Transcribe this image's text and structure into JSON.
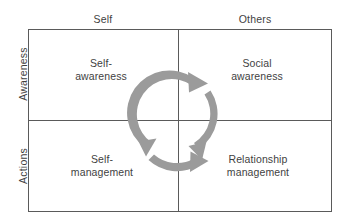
{
  "diagram": {
    "column_headers": [
      {
        "id": "self",
        "label": "Self"
      },
      {
        "id": "others",
        "label": "Others"
      }
    ],
    "row_headers": [
      {
        "id": "awareness",
        "label": "Awareness"
      },
      {
        "id": "actions",
        "label": "Actions"
      }
    ],
    "quadrants": [
      {
        "id": "self-awareness",
        "row": "Awareness",
        "column": "Self",
        "label": "Self-\nawareness"
      },
      {
        "id": "social-awareness",
        "row": "Awareness",
        "column": "Others",
        "label": "Social\nawareness"
      },
      {
        "id": "self-management",
        "row": "Actions",
        "column": "Self",
        "label": "Self-\nmanagement"
      },
      {
        "id": "relationship-management",
        "row": "Actions",
        "column": "Others",
        "label": "Relationship\nmanagement"
      }
    ],
    "cycle": {
      "name": "circular-cycle-arrows",
      "direction": "clockwise",
      "segment_count": 3,
      "segments": [
        {
          "id": "arrow-top-left-to-top-right",
          "from": "self-awareness",
          "to": "social-awareness"
        },
        {
          "id": "arrow-right-down",
          "from": "social-awareness",
          "to": "relationship-management"
        },
        {
          "id": "arrow-bottom-left-to-right",
          "from": "self-management",
          "to": "relationship-management"
        }
      ]
    },
    "colors": {
      "border": "#5a5a5a",
      "arrow": "#9b9b9b",
      "text": "#3f3f3f",
      "background": "#ffffff"
    }
  }
}
